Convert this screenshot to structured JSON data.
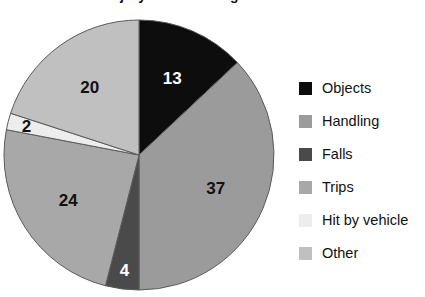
{
  "chart_data": {
    "type": "pie",
    "title": "Cause of Injury as Percentage",
    "xlabel": "",
    "ylabel": "",
    "legend_position": "right",
    "grid": false,
    "categories": [
      "Objects",
      "Handling",
      "Falls",
      "Trips",
      "Hit by vehicle",
      "Other"
    ],
    "values": [
      13,
      37,
      4,
      24,
      2,
      20
    ],
    "total": 100,
    "slices": [
      {
        "label": "Objects",
        "value": 13,
        "display": "13",
        "color": "#0d0d0d",
        "label_color": "#ffffff"
      },
      {
        "label": "Handling",
        "value": 37,
        "display": "37",
        "color": "#9b9b9b",
        "label_color": "#111111"
      },
      {
        "label": "Falls",
        "value": 4,
        "display": "4",
        "color": "#4a4a4a",
        "label_color": "#ffffff"
      },
      {
        "label": "Trips",
        "value": 24,
        "display": "24",
        "color": "#a8a8a8",
        "label_color": "#111111"
      },
      {
        "label": "Hit by vehicle",
        "value": 2,
        "display": "2",
        "color": "#ededed",
        "label_color": "#111111"
      },
      {
        "label": "Other",
        "value": 20,
        "display": "20",
        "color": "#c0c0c0",
        "label_color": "#111111"
      }
    ]
  },
  "legend": {
    "items": [
      {
        "label": "Objects",
        "color": "#0d0d0d"
      },
      {
        "label": "Handling",
        "color": "#9b9b9b"
      },
      {
        "label": "Falls",
        "color": "#4a4a4a"
      },
      {
        "label": "Trips",
        "color": "#a8a8a8"
      },
      {
        "label": "Hit by vehicle",
        "color": "#ededed"
      },
      {
        "label": "Other",
        "color": "#c0c0c0"
      }
    ]
  }
}
